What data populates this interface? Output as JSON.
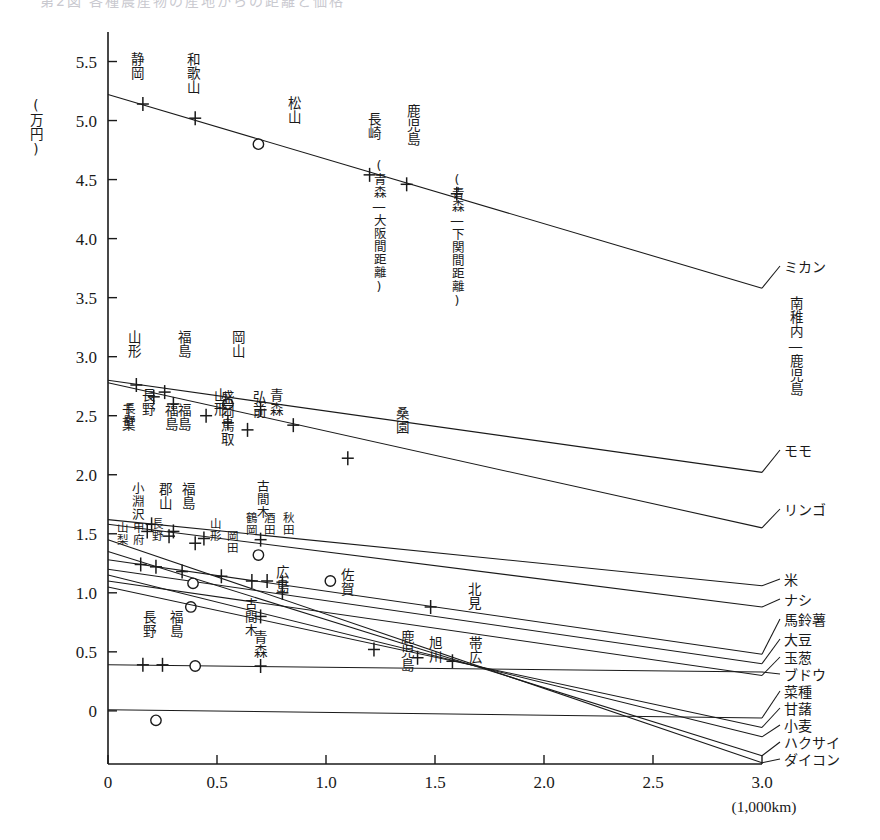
{
  "figure": {
    "cut_off_header": "第2図 各種農産物の産地からの距離と価格",
    "y_axis_unit": "(万円)",
    "x_axis_unit": "(1,000km)",
    "y_ticks": [
      "0",
      "0.5",
      "1.0",
      "1.5",
      "2.0",
      "2.5",
      "3.0",
      "3.5",
      "4.0",
      "4.5",
      "5.0",
      "5.5"
    ],
    "x_ticks": [
      "0",
      "0.5",
      "1.0",
      "1.5",
      "2.0",
      "2.5",
      "3.0"
    ]
  },
  "chart_data": {
    "type": "line",
    "title": "各種農産物の産地からの距離と価格",
    "xlabel": "(1,000km)",
    "ylabel": "(万円)",
    "xlim": [
      0,
      3.0
    ],
    "ylim": [
      -0.45,
      5.75
    ],
    "grid": false,
    "legend_position": "right-of-plot",
    "x_tick_values": [
      0,
      0.5,
      1.0,
      1.5,
      2.0,
      2.5,
      3.0
    ],
    "y_tick_values": [
      0,
      0.5,
      1.0,
      1.5,
      2.0,
      2.5,
      3.0,
      3.5,
      4.0,
      4.5,
      5.0,
      5.5
    ],
    "series": [
      {
        "name": "ミカン",
        "right_label": "ミカン",
        "right_sublabel": "南稚内―鹿児島",
        "endpoints": [
          [
            0.0,
            5.22
          ],
          [
            3.0,
            3.58
          ]
        ],
        "points": [
          {
            "x": 0.16,
            "y": 5.14,
            "marker": "plus",
            "label": "静岡"
          },
          {
            "x": 0.4,
            "y": 5.02,
            "marker": "plus",
            "label": "和歌山"
          },
          {
            "x": 0.69,
            "y": 4.8,
            "marker": "circle",
            "label": "松山"
          },
          {
            "x": 1.2,
            "y": 4.54,
            "marker": "plus",
            "label": "長崎",
            "note": "(青森―大阪間距離)"
          },
          {
            "x": 1.37,
            "y": 4.46,
            "marker": "plus",
            "label": "鹿児島"
          },
          {
            "x": 1.6,
            "y": 4.38,
            "marker": "plus",
            "note": "(青森―下関間距離)"
          }
        ]
      },
      {
        "name": "モモ",
        "right_label": "モモ",
        "endpoints": [
          [
            0.0,
            2.8
          ],
          [
            3.0,
            2.02
          ]
        ],
        "points": [
          {
            "x": 0.13,
            "y": 2.76,
            "marker": "plus",
            "label": "山形"
          },
          {
            "x": 0.26,
            "y": 2.7,
            "marker": "plus",
            "label": "福島"
          },
          {
            "x": 0.55,
            "y": 2.6,
            "marker": "circle",
            "label": "岡山"
          },
          {
            "x": 0.7,
            "y": 2.55,
            "marker": "plus",
            "label": "青森"
          },
          {
            "x": 0.85,
            "y": 2.42,
            "marker": "plus"
          }
        ]
      },
      {
        "name": "リンゴ",
        "right_label": "リンゴ",
        "endpoints": [
          [
            0.0,
            2.78
          ],
          [
            3.0,
            1.55
          ]
        ],
        "points": [
          {
            "x": 0.21,
            "y": 2.66,
            "marker": "plus",
            "label": "長野"
          },
          {
            "x": 0.3,
            "y": 2.6,
            "marker": "plus",
            "label": "福島"
          },
          {
            "x": 0.45,
            "y": 2.5,
            "marker": "plus",
            "label": "山形"
          },
          {
            "x": 0.55,
            "y": 2.44,
            "marker": "plus",
            "label": "盛岡"
          },
          {
            "x": 0.64,
            "y": 2.38,
            "marker": "plus",
            "label": "弘前"
          },
          {
            "x": 1.1,
            "y": 2.14,
            "marker": "plus",
            "label": "桑園"
          }
        ]
      },
      {
        "name": "米",
        "right_label": "米",
        "endpoints": [
          [
            0.0,
            1.62
          ],
          [
            3.0,
            1.06
          ]
        ],
        "points": [
          {
            "x": 0.2,
            "y": 1.58,
            "marker": "plus",
            "label": "千葉"
          },
          {
            "x": 0.3,
            "y": 1.52,
            "marker": "plus",
            "label": "長野"
          },
          {
            "x": 0.44,
            "y": 1.46,
            "marker": "plus",
            "label": "福島"
          },
          {
            "x": 0.7,
            "y": 1.45,
            "marker": "plus",
            "label": "古間木"
          }
        ]
      },
      {
        "name": "ナシ",
        "right_label": "ナシ",
        "endpoints": [
          [
            0.0,
            1.58
          ],
          [
            3.0,
            0.88
          ]
        ],
        "points": [
          {
            "x": 0.18,
            "y": 1.52,
            "marker": "plus",
            "label": "小淵沢"
          },
          {
            "x": 0.28,
            "y": 1.48,
            "marker": "plus",
            "label": "郡山"
          },
          {
            "x": 0.4,
            "y": 1.42,
            "marker": "plus",
            "label": "福島"
          },
          {
            "x": 0.69,
            "y": 1.32,
            "marker": "circle",
            "label": "鳥取"
          }
        ]
      },
      {
        "name": "馬鈴薯",
        "right_label": "馬鈴薯",
        "endpoints": [
          [
            0.0,
            1.28
          ],
          [
            3.0,
            0.48
          ]
        ],
        "points": [
          {
            "x": 0.15,
            "y": 1.24,
            "marker": "plus",
            "label": "甲府"
          },
          {
            "x": 0.22,
            "y": 1.22,
            "marker": "plus",
            "label": "山梨"
          },
          {
            "x": 0.34,
            "y": 1.18,
            "marker": "plus",
            "label": "長野"
          },
          {
            "x": 0.52,
            "y": 1.14,
            "marker": "plus",
            "label": "山形"
          },
          {
            "x": 0.66,
            "y": 1.1,
            "marker": "plus",
            "label": "鶴岡"
          },
          {
            "x": 0.73,
            "y": 1.1,
            "marker": "plus",
            "label": "酒田"
          },
          {
            "x": 0.8,
            "y": 1.09,
            "marker": "plus",
            "label": "秋田"
          },
          {
            "x": 1.02,
            "y": 1.1,
            "marker": "circle",
            "label": "佐賀"
          },
          {
            "x": 1.48,
            "y": 0.88,
            "marker": "plus",
            "label": "北見"
          }
        ]
      },
      {
        "name": "大豆",
        "right_label": "大豆",
        "endpoints": [
          [
            0.0,
            1.2
          ],
          [
            3.0,
            0.4
          ]
        ],
        "points": [
          {
            "x": 0.39,
            "y": 1.08,
            "marker": "circle",
            "label": "岡田"
          },
          {
            "x": 0.8,
            "y": 1.0,
            "marker": "plus",
            "label": "広島"
          }
        ]
      },
      {
        "name": "玉葱",
        "right_label": "玉葱",
        "endpoints": [
          [
            0.0,
            1.1
          ],
          [
            3.0,
            0.3
          ]
        ],
        "points": [
          {
            "x": 0.38,
            "y": 0.88,
            "marker": "circle"
          },
          {
            "x": 0.7,
            "y": 0.8,
            "marker": "plus",
            "label": "古間木"
          }
        ]
      },
      {
        "name": "ブドウ",
        "right_label": "ブドウ",
        "endpoints": [
          [
            0.0,
            0.39
          ],
          [
            3.0,
            0.33
          ]
        ],
        "points": [
          {
            "x": 0.16,
            "y": 0.39,
            "marker": "plus",
            "label": "長野"
          },
          {
            "x": 0.25,
            "y": 0.39,
            "marker": "plus",
            "label": "福島"
          },
          {
            "x": 0.4,
            "y": 0.38,
            "marker": "circle"
          },
          {
            "x": 0.7,
            "y": 0.38,
            "marker": "plus",
            "label": "青森"
          }
        ]
      },
      {
        "name": "菜種",
        "right_label": "菜種",
        "endpoints": [
          [
            0.0,
            0.01
          ],
          [
            3.0,
            -0.06
          ]
        ],
        "points": [
          {
            "x": 0.22,
            "y": -0.08,
            "marker": "circle"
          }
        ]
      },
      {
        "name": "甘藷",
        "right_label": "甘藷",
        "endpoints": [
          [
            0.0,
            1.05
          ],
          [
            3.0,
            -0.14
          ]
        ],
        "points": [
          {
            "x": 1.22,
            "y": 0.52,
            "marker": "plus",
            "label": "鹿児島"
          },
          {
            "x": 1.42,
            "y": 0.45,
            "marker": "plus",
            "label": "旭川"
          }
        ]
      },
      {
        "name": "小麦",
        "right_label": "小麦",
        "endpoints": [
          [
            0.0,
            1.15
          ],
          [
            3.0,
            -0.22
          ]
        ],
        "points": [
          {
            "x": 1.58,
            "y": 0.42,
            "marker": "plus",
            "label": "帯広"
          }
        ]
      },
      {
        "name": "ハクサイ",
        "right_label": "ハクサイ",
        "endpoints": [
          [
            0.0,
            1.35
          ],
          [
            3.0,
            -0.38
          ]
        ],
        "points": []
      },
      {
        "name": "ダイコン",
        "right_label": "ダイコン",
        "endpoints": [
          [
            0.0,
            1.45
          ],
          [
            3.0,
            -0.44
          ]
        ],
        "points": []
      }
    ]
  },
  "annotations": {
    "nagasaki_note": "(青森―大阪間距離)",
    "aomori_shimonoseki_note": "(青森―下関間距離)",
    "mikan_sub": "南稚内―鹿児島"
  }
}
